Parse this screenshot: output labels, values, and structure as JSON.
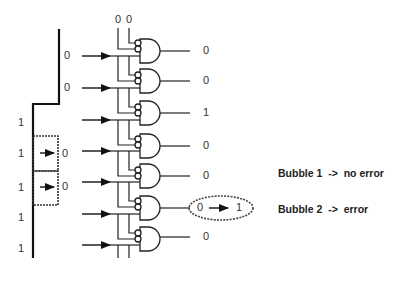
{
  "diagram": {
    "type": "thermometer-to-binary bubble error detection circuit",
    "thermometer_code": {
      "values_top_to_bottom": [
        "0",
        "0",
        "1",
        "1",
        "1",
        "1",
        "1"
      ],
      "left_values": [
        "1",
        "1",
        "1",
        "1",
        "1"
      ],
      "step_values": [
        "0",
        "0"
      ],
      "bubble_values": [
        "0",
        "0"
      ]
    },
    "top_inputs": [
      "0",
      "0"
    ],
    "gate_outputs": [
      "0",
      "0",
      "1",
      "0",
      "0",
      "0",
      "0"
    ],
    "highlight": {
      "from": "0",
      "to": "1"
    },
    "notes": [
      "Bubble 1  ->  no error",
      "Bubble 2  ->  error"
    ]
  },
  "labels": {
    "top0": "0",
    "top1": "0",
    "in0": "0",
    "in1": "0",
    "left1": "1",
    "left2": "1",
    "left3": "1",
    "left4": "1",
    "left5": "1",
    "bub1": "0",
    "bub2": "0",
    "out0": "0",
    "out1": "0",
    "out2": "1",
    "out3": "0",
    "out4": "0",
    "out6": "0",
    "hl_from": "0",
    "hl_to": "1",
    "note1": "Bubble 1  ->  no error",
    "note2": "Bubble 2  ->  error"
  }
}
